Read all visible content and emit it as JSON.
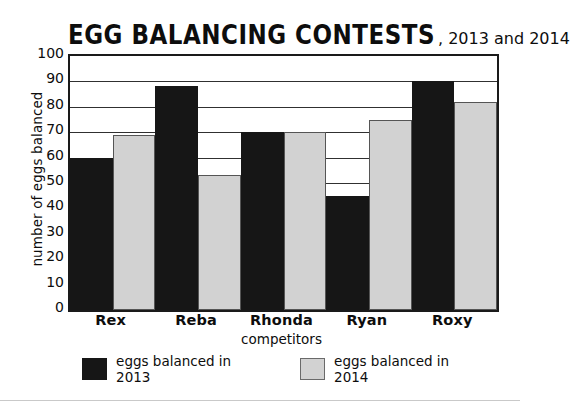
{
  "chart_data": {
    "type": "bar",
    "title": "EGG BALANCING CONTESTS",
    "title_suffix": ", 2013 and 2014",
    "xlabel": "competitors",
    "ylabel": "number of eggs balanced",
    "categories": [
      "Rex",
      "Reba",
      "Rhonda",
      "Ryan",
      "Roxy"
    ],
    "series": [
      {
        "name": "eggs balanced in 2013",
        "color": "#161616",
        "values": [
          60,
          88,
          70,
          45,
          90
        ]
      },
      {
        "name": "eggs balanced in 2014",
        "color": "#d2d2d2",
        "values": [
          69,
          53,
          70,
          75,
          82
        ]
      }
    ],
    "ylim": [
      0,
      100
    ],
    "ytick_labels": [
      "100",
      "90",
      "80",
      "70",
      "60",
      "50",
      "40",
      "30",
      "20",
      "10",
      "0"
    ],
    "ytick_values": [
      100,
      90,
      80,
      70,
      60,
      50,
      40,
      30,
      20,
      10,
      0
    ],
    "grid": true,
    "legend_position": "bottom"
  }
}
